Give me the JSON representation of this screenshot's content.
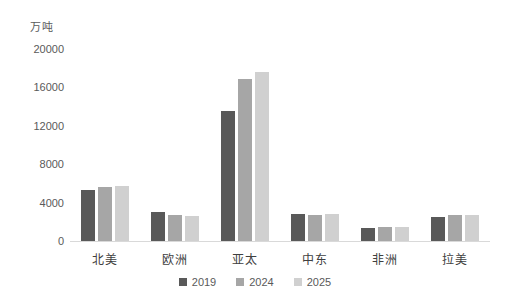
{
  "chart_data": {
    "type": "bar",
    "title": "",
    "subtitle": "",
    "unit_label": "万吨",
    "xlabel": "",
    "ylabel": "",
    "ylim": [
      0,
      20000
    ],
    "ytick_values": [
      0,
      4000,
      8000,
      12000,
      16000,
      20000
    ],
    "ytick_labels": [
      "0",
      "4000",
      "8000",
      "12000",
      "16000",
      "20000"
    ],
    "grid": false,
    "legend_position": "bottom",
    "categories": [
      "北美",
      "欧洲",
      "亚太",
      "中东",
      "非洲",
      "拉美"
    ],
    "series": [
      {
        "name": "2019",
        "color": "#595959",
        "values": [
          5300,
          3000,
          13540,
          2800,
          1400,
          2450
        ]
      },
      {
        "name": "2024",
        "color": "#a6a6a6",
        "values": [
          5600,
          2700,
          16880,
          2750,
          1450,
          2700
        ]
      },
      {
        "name": "2025",
        "color": "#d0d0d0",
        "values": [
          5750,
          2650,
          17600,
          2800,
          1500,
          2700
        ]
      }
    ]
  },
  "colors": {
    "background": "#ffffff",
    "axis": "#d9d9d9",
    "text": "#5a5a5a",
    "series_2019": "#595959",
    "series_2024": "#a6a6a6",
    "series_2025": "#d0d0d0"
  }
}
